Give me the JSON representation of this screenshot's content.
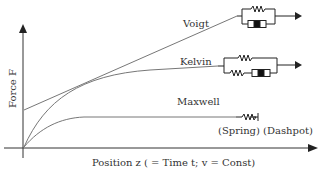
{
  "figure": {
    "y_axis_label": "Force F",
    "x_axis_label": "Position z ( = Time t; v = Const)",
    "models": [
      {
        "name": "Voigt",
        "label": "Voigt",
        "elements": "spring parallel with dashpot"
      },
      {
        "name": "Kelvin",
        "label": "Kelvin",
        "elements": "spring parallel with (spring series dashpot)"
      },
      {
        "name": "Maxwell",
        "label": "Maxwell",
        "elements": "spring series dashpot"
      }
    ],
    "maxwell_caption": "(Spring) (Dashpot)",
    "colors": {
      "curve": "#777777",
      "axis": "#333333",
      "text": "#333333",
      "dashpot_fill": "#111111"
    }
  }
}
